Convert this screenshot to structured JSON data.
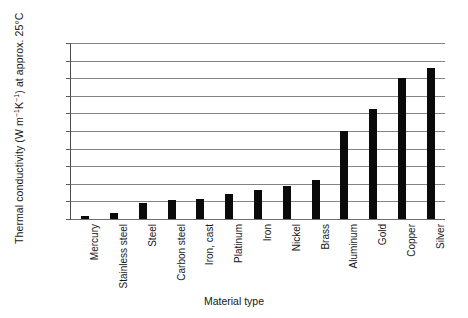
{
  "chart_data": {
    "type": "bar",
    "title": "",
    "subtitle": "",
    "xlabel": "Material type",
    "ylabel": "Thermal conductivity (W m⁻¹K⁻¹) at approx. 25°C",
    "ylabel_parts": {
      "lead": "Thermal conductivity (W m",
      "sup1": "−1",
      "mid": "K",
      "sup2": "−1",
      "tail": ") at approx. 25°C"
    },
    "categories": [
      "Mercury",
      "Stainless steel",
      "Steel",
      "Carbon steel",
      "Iron, cast",
      "Platinum",
      "Iron",
      "Nickel",
      "Brass",
      "Aluminum",
      "Gold",
      "Copper",
      "Silver"
    ],
    "values": [
      8,
      16,
      46,
      54,
      58,
      71,
      83,
      94,
      110,
      250,
      313,
      401,
      430
    ],
    "ylim": [
      0,
      500
    ],
    "ytick_step": 50,
    "yticks": [
      0,
      50,
      100,
      150,
      200,
      250,
      300,
      350,
      400,
      450,
      500
    ],
    "ytick_labels": [
      "0",
      "50",
      "100",
      "150",
      "200",
      "250",
      "300",
      "350",
      "400",
      "450",
      "500"
    ],
    "grid": true,
    "grid_axis": "y",
    "legend": false,
    "legend_position": "none",
    "bar_color": "#0a0a0a",
    "gridline_color": "#848484",
    "axis_color": "#4a4a4a",
    "background_color": "#ffffff",
    "text_color": "#171717"
  }
}
